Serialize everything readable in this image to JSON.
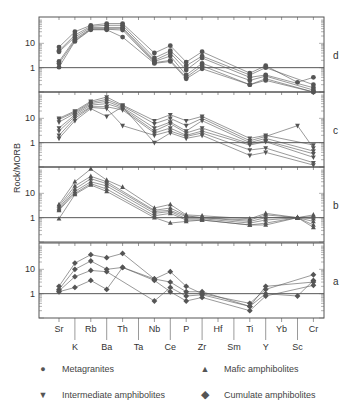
{
  "chart_data": {
    "type": "line",
    "ylabel": "Rock/MORB",
    "yscale": "log",
    "ylim": [
      0.1,
      100
    ],
    "categories_top_row": [
      "Sr",
      "Rb",
      "Th",
      "Nb",
      "P",
      "Hf",
      "Ti",
      "Yb",
      "Cr"
    ],
    "categories_bottom_row": [
      "K",
      "Ba",
      "Ta",
      "Ce",
      "Zr",
      "Sm",
      "Y",
      "Sc"
    ],
    "categories": [
      "Sr",
      "K",
      "Rb",
      "Ba",
      "Th",
      "Ta",
      "Nb",
      "Ce",
      "P",
      "Zr",
      "Hf",
      "Sm",
      "Ti",
      "Y",
      "Yb",
      "Sc",
      "Cr"
    ],
    "ytick_labels": [
      "1",
      "10"
    ],
    "panels": [
      {
        "label": "d",
        "marker": "circle",
        "group": "Metagranites",
        "series": [
          {
            "values": [
              7,
              30,
              55,
              65,
              65,
              null,
              4,
              8,
              1.7,
              4.5,
              null,
              null,
              0.6,
              1.2,
              null,
              0.25,
              0.4
            ]
          },
          {
            "values": [
              5,
              22,
              50,
              55,
              55,
              null,
              2.5,
              5,
              1.2,
              3,
              null,
              null,
              0.5,
              1.0,
              null,
              null,
              0.2
            ]
          },
          {
            "values": [
              4.5,
              18,
              45,
              45,
              45,
              null,
              2,
              4,
              0.8,
              2.5,
              null,
              null,
              0.4,
              0.5,
              null,
              null,
              0.15
            ]
          },
          {
            "values": [
              1.8,
              15,
              40,
              40,
              40,
              null,
              1.8,
              3,
              0.5,
              1.5,
              null,
              null,
              0.3,
              0.45,
              null,
              null,
              0.12
            ]
          },
          {
            "values": [
              1.5,
              13,
              38,
              38,
              35,
              null,
              1.6,
              2,
              0.4,
              1.2,
              null,
              null,
              0.2,
              0.35,
              null,
              null,
              0.1
            ]
          },
          {
            "values": [
              1.05,
              12,
              36,
              36,
              18,
              null,
              1.5,
              1.8,
              0.35,
              0.9,
              null,
              null,
              0.2,
              0.3,
              null,
              null,
              0.1
            ]
          }
        ]
      },
      {
        "label": "c",
        "marker": "triangle-down",
        "group": "Intermediate amphibolites",
        "series": [
          {
            "values": [
              10,
              20,
              50,
              75,
              35,
              null,
              8,
              14,
              8,
              12,
              null,
              null,
              1.5,
              2,
              null,
              null,
              0.8
            ]
          },
          {
            "values": [
              9,
              18,
              45,
              60,
              32,
              null,
              6,
              10,
              5,
              10,
              null,
              null,
              1.2,
              1.8,
              null,
              5,
              0.6
            ]
          },
          {
            "values": [
              7,
              16,
              40,
              50,
              28,
              null,
              4,
              7,
              3,
              8,
              null,
              null,
              1.0,
              1.5,
              null,
              null,
              0.45
            ]
          },
          {
            "values": [
              4,
              14,
              35,
              40,
              25,
              null,
              3,
              6,
              2.5,
              4,
              null,
              null,
              0.9,
              1.2,
              null,
              null,
              0.35
            ]
          },
          {
            "values": [
              3,
              12,
              30,
              30,
              22,
              null,
              2.5,
              4,
              2,
              3,
              null,
              null,
              0.8,
              1.1,
              null,
              null,
              0.25
            ]
          },
          {
            "values": [
              2,
              10,
              28,
              25,
              5,
              null,
              2,
              3,
              1.8,
              2.5,
              null,
              null,
              0.5,
              0.6,
              null,
              null,
              0.15
            ]
          },
          {
            "values": [
              1.5,
              8,
              25,
              12,
              30,
              null,
              1,
              2.5,
              1.5,
              2,
              null,
              null,
              0.3,
              0.4,
              null,
              null,
              0.12
            ]
          }
        ]
      },
      {
        "label": "b",
        "marker": "triangle-up",
        "group": "Mafic amphibolites",
        "series": [
          {
            "values": [
              3.5,
              30,
              100,
              35,
              18,
              null,
              2.5,
              3.5,
              1.3,
              1.2,
              null,
              null,
              0.9,
              1.5,
              null,
              1.0,
              1.3
            ]
          },
          {
            "values": [
              3,
              20,
              50,
              30,
              null,
              null,
              2,
              2.5,
              1.2,
              1.0,
              null,
              null,
              0.8,
              1.3,
              null,
              1.0,
              1.1
            ]
          },
          {
            "values": [
              2.5,
              15,
              40,
              25,
              null,
              null,
              1.8,
              2,
              1.1,
              1.0,
              null,
              null,
              0.7,
              1.0,
              null,
              1.0,
              0.9
            ]
          },
          {
            "values": [
              2.2,
              12,
              30,
              20,
              null,
              null,
              1.5,
              1.8,
              0.9,
              0.9,
              null,
              null,
              0.6,
              0.8,
              null,
              1.0,
              0.7
            ]
          },
          {
            "values": [
              2,
              10,
              25,
              15,
              null,
              null,
              1.2,
              1.5,
              0.8,
              0.8,
              null,
              null,
              0.5,
              0.6,
              null,
              1.0,
              0.5
            ]
          },
          {
            "values": [
              0.9,
              9,
              22,
              12,
              null,
              null,
              1.0,
              0.6,
              0.7,
              0.8,
              null,
              null,
              0.5,
              0.5,
              null,
              1.0,
              0.4
            ]
          }
        ]
      },
      {
        "label": "a",
        "marker": "diamond",
        "group": "Cumulate amphibolites",
        "series": [
          {
            "values": [
              2,
              18,
              40,
              30,
              45,
              null,
              4,
              8,
              2,
              1.0,
              null,
              null,
              0.4,
              1.5,
              null,
              null,
              6
            ]
          },
          {
            "values": [
              1.5,
              10,
              22,
              10,
              12,
              null,
              4,
              3,
              1.2,
              1.2,
              null,
              null,
              0.3,
              1.0,
              null,
              0.8,
              3.5
            ]
          },
          {
            "values": [
              1.3,
              5,
              9,
              8,
              null,
              null,
              0.5,
              1.8,
              0.8,
              0.9,
              null,
              null,
              0.3,
              2.0,
              null,
              null,
              3
            ]
          },
          {
            "values": [
              1.2,
              1.8,
              3.5,
              1.5,
              12,
              null,
              3.5,
              1.2,
              0.5,
              0.7,
              null,
              null,
              0.2,
              0.8,
              null,
              null,
              2.2
            ]
          }
        ]
      }
    ],
    "legend": [
      {
        "symbol": "circle",
        "label": "Metagranites"
      },
      {
        "symbol": "triangle-up",
        "label": "Mafic amphibolites"
      },
      {
        "symbol": "triangle-down",
        "label": "Intermediate amphibolites"
      },
      {
        "symbol": "diamond",
        "label": "Cumulate amphibolites"
      }
    ]
  }
}
